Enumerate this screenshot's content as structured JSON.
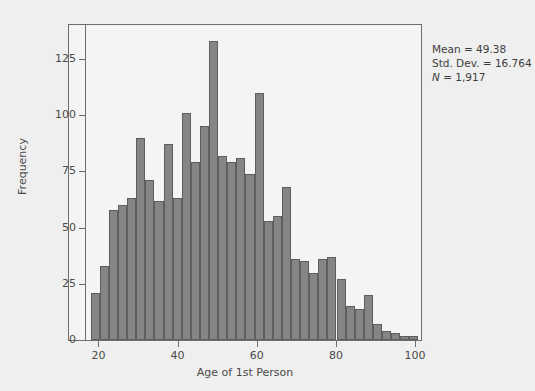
{
  "chart_data": {
    "type": "bar",
    "title": "",
    "xlabel": "Age of 1st Person",
    "ylabel": "Frequency",
    "xlim": [
      16.6,
      101.5
    ],
    "ylim": [
      0,
      140
    ],
    "xticks": [
      20,
      40,
      60,
      80,
      100
    ],
    "yticks": [
      0,
      25,
      50,
      75,
      100,
      125
    ],
    "grid": false,
    "legend": null,
    "bin_width": 2.3,
    "bar_color": "#858585",
    "bar_edge_color": "#5e5e5e",
    "categories": [
      19.2,
      21.5,
      23.8,
      26.1,
      28.4,
      30.7,
      33.0,
      35.3,
      37.6,
      39.9,
      42.2,
      44.5,
      46.8,
      49.1,
      51.4,
      53.7,
      56.0,
      58.3,
      60.6,
      62.9,
      65.2,
      67.5,
      69.8,
      72.1,
      74.4,
      76.7,
      79.0,
      81.3,
      83.6,
      85.9,
      88.2,
      90.5,
      92.8,
      95.1,
      97.4,
      99.7
    ],
    "values": [
      21,
      33,
      58,
      60,
      63,
      90,
      71,
      62,
      87,
      63,
      101,
      79,
      95,
      133,
      82,
      79,
      81,
      74,
      110,
      53,
      55,
      68,
      36,
      35,
      30,
      36,
      37,
      27,
      15,
      14,
      20,
      7,
      4,
      3,
      2,
      2
    ],
    "xlabels_note": "bars span ages ~18 to ~101 in 2.3-year bins"
  },
  "stats": {
    "mean_label": "Mean = 49.38",
    "std_dev_label": "Std. Dev. = 16.764",
    "n_symbol": "N",
    "n_value": " = 1,917"
  },
  "axes": {
    "y_title": "Frequency",
    "x_title": "Age of 1st Person",
    "y_tick_labels": [
      "125",
      "100",
      "75",
      "50",
      "25",
      "0"
    ],
    "x_tick_labels": [
      "20",
      "40",
      "60",
      "80",
      "100"
    ]
  },
  "colors": {
    "background": "#efefef",
    "plot_background": "#f4f4f4",
    "frame": "#6e6e6e",
    "bar": "#858585",
    "bar_edge": "#5e5e5e",
    "text": "#4a4a4a"
  }
}
